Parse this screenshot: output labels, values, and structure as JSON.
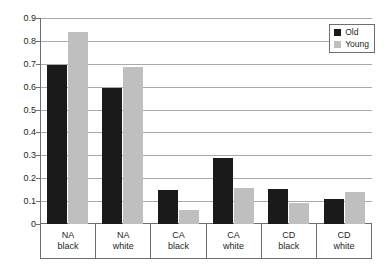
{
  "chart_data": {
    "type": "bar",
    "title": "",
    "xlabel": "",
    "ylabel": "",
    "ylim": [
      0,
      0.9
    ],
    "grid": true,
    "legend_position": "top-right",
    "categories": [
      "NA black",
      "NA white",
      "CA black",
      "CA white",
      "CD black",
      "CD white"
    ],
    "category_lines": [
      [
        "NA",
        "black"
      ],
      [
        "NA",
        "white"
      ],
      [
        "CA",
        "black"
      ],
      [
        "CA",
        "white"
      ],
      [
        "CD",
        "black"
      ],
      [
        "CD",
        "white"
      ]
    ],
    "ytick_labels": [
      "0.9",
      "0.8",
      "0.7",
      "0.6",
      "0.5",
      "0.4",
      "0.3",
      "0.2",
      "0.1",
      "0"
    ],
    "ytick_values": [
      0.9,
      0.8,
      0.7,
      0.6,
      0.5,
      0.4,
      0.3,
      0.2,
      0.1,
      0
    ],
    "series": [
      {
        "name": "Old",
        "color": "#1a1a1a",
        "values": [
          0.695,
          0.595,
          0.148,
          0.29,
          0.152,
          0.11
        ]
      },
      {
        "name": "Young",
        "color": "#bfbfbf",
        "values": [
          0.84,
          0.685,
          0.06,
          0.158,
          0.09,
          0.14
        ]
      }
    ]
  },
  "legend": {
    "items": [
      {
        "label": "Old",
        "color": "#1a1a1a"
      },
      {
        "label": "Young",
        "color": "#bfbfbf"
      }
    ]
  },
  "caption": {
    "text": ""
  }
}
